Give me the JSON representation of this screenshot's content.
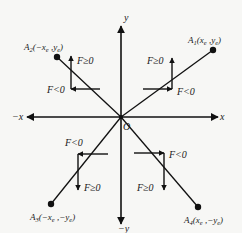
{
  "diagram": {
    "colors": {
      "background": "#f7f7f5",
      "ink": "#111111"
    },
    "axes": {
      "x_pos_label": "x",
      "x_neg_label": "−x",
      "y_pos_label": "y",
      "y_neg_label": "−y",
      "origin_label": "O"
    },
    "points": [
      {
        "id": "A1",
        "name": "A",
        "sub": "1",
        "coords": "(x",
        "coords_sub1": "e",
        "coords_mid": " ,y",
        "coords_sub2": "e",
        "coords_end": ")",
        "full": "A1(xe ,ye)"
      },
      {
        "id": "A2",
        "name": "A",
        "sub": "2",
        "coords": "(−x",
        "coords_sub1": "e",
        "coords_mid": " ,y",
        "coords_sub2": "e",
        "coords_end": ")",
        "full": "A2(−xe ,ye)"
      },
      {
        "id": "A3",
        "name": "A",
        "sub": "3",
        "coords": "(−x",
        "coords_sub1": "e",
        "coords_mid": " ,−y",
        "coords_sub2": "e",
        "coords_end": ")",
        "full": "A3(−xe ,−ye)"
      },
      {
        "id": "A4",
        "name": "A",
        "sub": "4",
        "coords": "(x",
        "coords_sub1": "e",
        "coords_mid": " ,−y",
        "coords_sub2": "e",
        "coords_end": ")",
        "full": "A4(xe ,−ye)"
      }
    ],
    "quadrants": [
      {
        "id": "q1",
        "f_ge": "F≥0",
        "f_lt": "F<0"
      },
      {
        "id": "q2",
        "f_ge": "F≥0",
        "f_lt": "F<0"
      },
      {
        "id": "q3",
        "f_ge": "F≥0",
        "f_lt": "F<0"
      },
      {
        "id": "q4",
        "f_ge": "F≥0",
        "f_lt": "F<0"
      }
    ]
  }
}
